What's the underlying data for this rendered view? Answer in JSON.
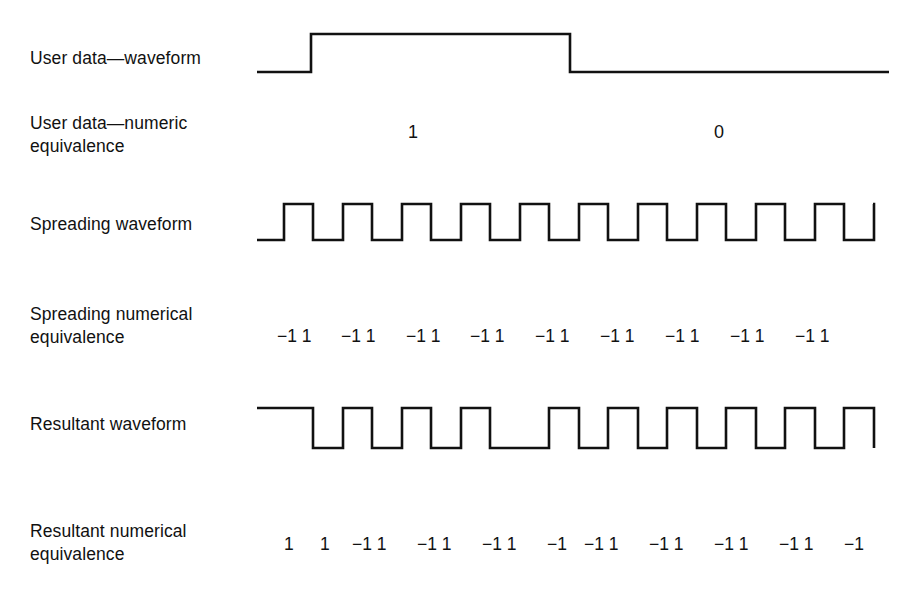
{
  "figure": {
    "background": "#ffffff",
    "stroke_color": "#111111"
  },
  "rows": [
    {
      "id": "user-waveform",
      "label": "User data—waveform"
    },
    {
      "id": "user-numeric",
      "label": "User data—numeric\nequivalence"
    },
    {
      "id": "spreading-waveform",
      "label": "Spreading waveform"
    },
    {
      "id": "spreading-numeric",
      "label": "Spreading numerical\nequivalence"
    },
    {
      "id": "resultant-waveform",
      "label": "Resultant waveform"
    },
    {
      "id": "resultant-numeric",
      "label": "Resultant numerical\nequivalence"
    }
  ],
  "chart_data": {
    "type": "line",
    "xlabel": "",
    "ylabel": "",
    "series": [
      {
        "name": "User data—waveform",
        "kind": "digital-waveform",
        "bits": [
          1,
          0
        ],
        "levels": [
          0,
          1,
          1,
          0
        ],
        "transitions_px": [
          282,
          311,
          570,
          889
        ],
        "description": "Low lead-in, high for bit 1, low for bit 0"
      },
      {
        "name": "Spreading waveform",
        "kind": "digital-waveform",
        "chips": [
          -1,
          1,
          -1,
          1,
          -1,
          1,
          -1,
          1,
          -1,
          1,
          -1,
          1,
          -1,
          1,
          -1,
          1,
          -1,
          1,
          -1,
          1
        ],
        "chip_width_px": 29.5,
        "start_px": 282,
        "end_px": 873,
        "start_level": "low",
        "cycle_count": 10
      },
      {
        "name": "Resultant waveform",
        "kind": "digital-waveform",
        "chips": [
          1,
          1,
          -1,
          1,
          -1,
          1,
          -1,
          1,
          -1,
          -1,
          1,
          -1,
          1,
          -1,
          1,
          -1,
          1,
          -1
        ],
        "chip_width_px": 29.5,
        "start_px": 282,
        "end_px": 873,
        "start_level": "high",
        "description": "Spreading waveform multiplied by user data; phase inverts at the bit boundary"
      }
    ],
    "annotations": [
      {
        "text": "1",
        "row": "user-numeric",
        "x_px": 413
      },
      {
        "text": "0",
        "row": "user-numeric",
        "x_px": 719
      }
    ]
  },
  "user_numeric": {
    "values": [
      {
        "text": "1",
        "x": 408
      },
      {
        "text": "0",
        "x": 714
      }
    ]
  },
  "spreading_numeric": {
    "values": [
      {
        "text": "−1 1",
        "x": 277
      },
      {
        "text": "−1 1",
        "x": 341
      },
      {
        "text": "−1 1",
        "x": 406
      },
      {
        "text": "−1 1",
        "x": 470
      },
      {
        "text": "−1 1",
        "x": 535
      },
      {
        "text": "−1 1",
        "x": 600
      },
      {
        "text": "−1 1",
        "x": 665
      },
      {
        "text": "−1 1",
        "x": 730
      },
      {
        "text": "−1 1",
        "x": 795
      }
    ]
  },
  "resultant_numeric": {
    "values": [
      {
        "text": "1",
        "x": 284
      },
      {
        "text": "1",
        "x": 320
      },
      {
        "text": "−1 1",
        "x": 352
      },
      {
        "text": "−1 1",
        "x": 417
      },
      {
        "text": "−1 1",
        "x": 482
      },
      {
        "text": "−1",
        "x": 547
      },
      {
        "text": "−1 1",
        "x": 584
      },
      {
        "text": "−1 1",
        "x": 649
      },
      {
        "text": "−1 1",
        "x": 714
      },
      {
        "text": "−1 1",
        "x": 779
      },
      {
        "text": "−1",
        "x": 844
      }
    ]
  },
  "paths": {
    "user_waveform": "M 2,50 L 56,50 L 56,12 L 315,12 L 315,50 L 634,50",
    "spreading_waveform": "M 2,48 L 29,48 L 29,12 L 58,12 L 58,48 L 88,48 L 88,12 L 117,12 L 117,48 L 147,48 L 147,12 L 176,12 L 176,48 L 206,48 L 206,12 L 235,12 L 235,48 L 265,48 L 265,12 L 294,12 L 294,48 L 324,48 L 324,12 L 353,12 L 353,48 L 383,48 L 383,12 L 412,12 L 412,48 L 442,48 L 442,12 L 471,12 L 471,48 L 501,48 L 501,12 L 530,12 L 530,48 L 560,48 L 560,12 L 589,12 L 589,48 L 619,48 L 619,12 L 618,12",
    "resultant_waveform": "M 2,12 L 58,12 L 58,52 L 88,52 L 88,12 L 117,12 L 117,52 L 147,52 L 147,12 L 176,12 L 176,52 L 206,52 L 206,12 L 235,12 L 235,52 L 294,52 L 294,12 L 324,12 L 324,52 L 353,52 L 353,12 L 383,12 L 383,52 L 412,52 L 412,12 L 442,12 L 442,52 L 471,52 L 471,12 L 501,12 L 501,52 L 530,52 L 530,12 L 560,12 L 560,52 L 589,52 L 589,12 L 619,12 L 619,52"
  }
}
